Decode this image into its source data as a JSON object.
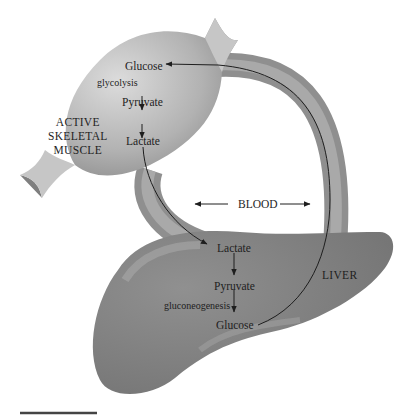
{
  "diagram": {
    "muscle": {
      "label_lines": [
        "ACTIVE",
        "SKELETAL",
        "MUSCLE"
      ],
      "molecules": [
        "Glucose",
        "Pyruvate",
        "Lactate"
      ],
      "process": "glycolysis"
    },
    "liver": {
      "label": "LIVER",
      "molecules": [
        "Lactate",
        "Pyruvate",
        "Glucose"
      ],
      "process": "gluconeogenesis"
    },
    "blood": {
      "label": "BLOOD"
    },
    "colors": {
      "muscle_light": "#d2d2d2",
      "muscle_dark": "#8c8c8c",
      "tendon": "#c4c4c4",
      "vessel": "#9a9a9a",
      "liver": "#7d7d7d",
      "text": "#1e1e1e",
      "background": "#ffffff"
    }
  }
}
